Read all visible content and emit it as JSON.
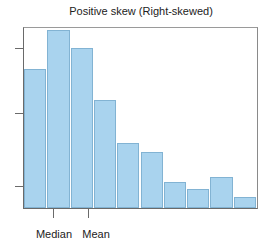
{
  "chart_data": {
    "type": "bar",
    "title": "Positive skew (Right-skewed)",
    "xlabel": "",
    "ylabel": "",
    "categories": [
      "1",
      "2",
      "3",
      "4",
      "5",
      "6",
      "7",
      "8",
      "9",
      "10"
    ],
    "values": [
      139,
      178,
      160,
      108,
      65,
      56,
      26,
      19,
      31,
      11
    ],
    "ylim": [
      0,
      180
    ],
    "y_ticks_labeled": false,
    "grid": false,
    "legend": null,
    "annotations": [
      {
        "label": "Median",
        "x_position": "between bar 2 center-left (~x index 1.2)"
      },
      {
        "label": "Mean",
        "x_position": "around bar 3 right-center (~x index 2.7)"
      }
    ],
    "colors": {
      "bar_fill": "#a9d3ee",
      "bar_border": "#82b3d3",
      "axis": "#6a6a6a"
    }
  },
  "labels": {
    "title": "Positive skew (Right-skewed)",
    "median": "Median",
    "mean": "Mean"
  }
}
